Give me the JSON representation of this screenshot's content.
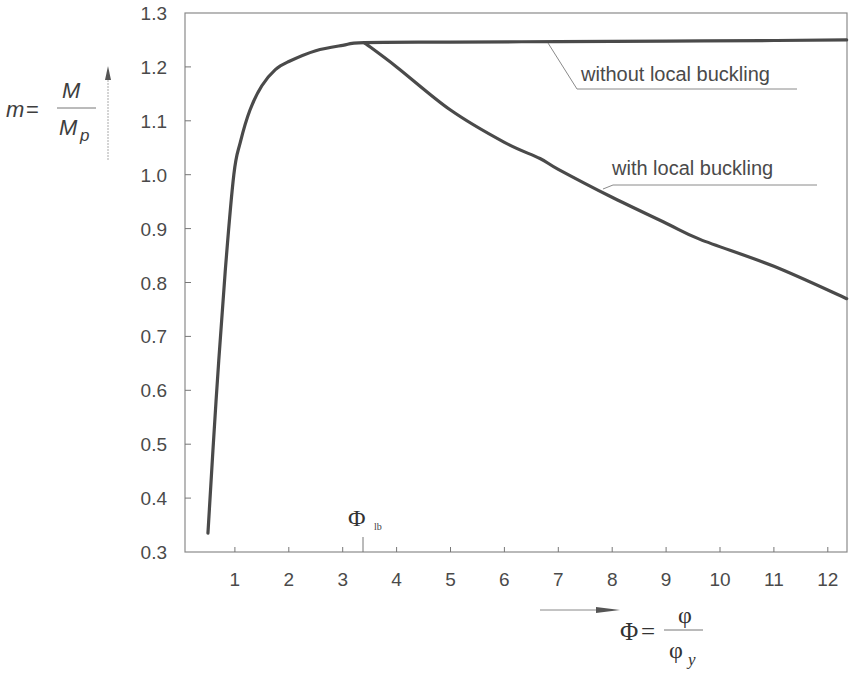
{
  "chart_data": {
    "type": "line",
    "title": "",
    "xlabel": "Φ = φ / φ_y",
    "ylabel": "m = M / M_p",
    "xlim": [
      0.07,
      12.35
    ],
    "ylim": [
      0.3,
      1.3
    ],
    "grid": false,
    "legend": "inline annotations",
    "x_ticks": [
      1,
      2,
      3,
      4,
      5,
      6,
      7,
      8,
      9,
      10,
      11,
      12
    ],
    "y_ticks": [
      0.3,
      0.4,
      0.5,
      0.6,
      0.7,
      0.8,
      0.9,
      1.0,
      1.1,
      1.2,
      1.3
    ],
    "x_tick_labels": [
      "1",
      "2",
      "3",
      "4",
      "5",
      "6",
      "7",
      "8",
      "9",
      "10",
      "11",
      "12"
    ],
    "y_tick_labels": [
      "0.3",
      "0.4",
      "0.5",
      "0.6",
      "0.7",
      "0.8",
      "0.9",
      "1.0",
      "1.1",
      "1.2",
      "1.3"
    ],
    "special_x_tick": {
      "x": 3.4,
      "label": "Φ",
      "subscript": "lb"
    },
    "series": [
      {
        "name": "without local buckling",
        "x": [
          0.5,
          0.65,
          0.82,
          0.98,
          1.1,
          1.28,
          1.5,
          1.75,
          2.0,
          2.5,
          3.0,
          3.4,
          5.0,
          7.0,
          9.0,
          11.0,
          12.35
        ],
        "y": [
          0.335,
          0.58,
          0.82,
          1.0,
          1.06,
          1.12,
          1.165,
          1.195,
          1.21,
          1.23,
          1.24,
          1.245,
          1.246,
          1.247,
          1.248,
          1.249,
          1.25
        ]
      },
      {
        "name": "with local buckling",
        "x": [
          3.4,
          4.0,
          5.0,
          6.0,
          6.66,
          7.0,
          7.96,
          9.0,
          9.63,
          11.0,
          12.35
        ],
        "y": [
          1.245,
          1.2,
          1.12,
          1.06,
          1.03,
          1.01,
          0.96,
          0.91,
          0.88,
          0.83,
          0.77
        ]
      }
    ],
    "annotations": [
      {
        "text": "without local buckling",
        "points_to": {
          "x": 6.7,
          "y": 1.247
        }
      },
      {
        "text": "with local buckling",
        "points_to": {
          "x": 7.9,
          "y": 0.96
        }
      }
    ]
  },
  "labels": {
    "y_axis": {
      "lhs": "m",
      "equals": "=",
      "numerator": "M",
      "denominator": "M",
      "denominator_sub": "p"
    },
    "x_axis": {
      "lhs": "Φ",
      "equals": "=",
      "numerator": "φ",
      "denominator": "φ",
      "denominator_sub": "y"
    },
    "phi_lb": {
      "symbol": "Φ",
      "sub": "lb"
    },
    "annotation_without": "without local buckling",
    "annotation_with": "with local buckling"
  },
  "colors": {
    "curve": "#4a4a4a",
    "axis": "#6a6a6a",
    "text": "#4a4a4a"
  }
}
